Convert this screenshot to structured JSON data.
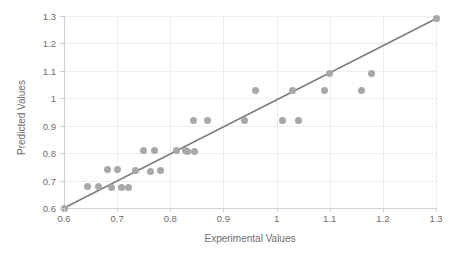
{
  "chart_data": {
    "type": "scatter",
    "title": "",
    "xlabel": "Experimental Values",
    "ylabel": "Predicted Values",
    "xlim": [
      0.6,
      1.3
    ],
    "ylim": [
      0.6,
      1.3
    ],
    "xticks": [
      "0.6",
      "0.7",
      "0.8",
      "0.9",
      "1",
      "1.1",
      "1.2",
      "1.3"
    ],
    "xtick_values": [
      0.6,
      0.7,
      0.8,
      0.9,
      1.0,
      1.1,
      1.2,
      1.3
    ],
    "yticks": [
      "0.6",
      "0.7",
      "0.8",
      "0.9",
      "1",
      "1.1",
      "1.2",
      "1.3"
    ],
    "ytick_values": [
      0.6,
      0.7,
      0.8,
      0.9,
      1.0,
      1.1,
      1.2,
      1.3
    ],
    "grid": true,
    "legend": false,
    "marker_color": "#a8a8a8",
    "line_color": "#7d7d7d",
    "grid_color": "#ededed",
    "axis_color": "#d2d2d2",
    "text_color": "#6d6d6d",
    "series": [
      {
        "name": "Predicted vs Experimental",
        "points": [
          [
            0.6,
            0.6
          ],
          [
            0.645,
            0.68
          ],
          [
            0.665,
            0.68
          ],
          [
            0.682,
            0.74
          ],
          [
            0.69,
            0.675
          ],
          [
            0.701,
            0.74
          ],
          [
            0.708,
            0.675
          ],
          [
            0.722,
            0.675
          ],
          [
            0.735,
            0.735
          ],
          [
            0.75,
            0.81
          ],
          [
            0.762,
            0.732
          ],
          [
            0.77,
            0.81
          ],
          [
            0.782,
            0.738
          ],
          [
            0.811,
            0.81
          ],
          [
            0.828,
            0.81
          ],
          [
            0.833,
            0.806
          ],
          [
            0.843,
            0.92
          ],
          [
            0.845,
            0.806
          ],
          [
            0.87,
            0.92
          ],
          [
            0.94,
            0.92
          ],
          [
            0.96,
            1.03
          ],
          [
            1.012,
            0.92
          ],
          [
            1.03,
            1.03
          ],
          [
            1.042,
            0.92
          ],
          [
            1.1,
            1.09
          ],
          [
            1.09,
            1.03
          ],
          [
            1.16,
            1.03
          ],
          [
            1.178,
            1.09
          ],
          [
            1.3,
            1.29
          ]
        ]
      }
    ],
    "trendline": {
      "name": "identity-line",
      "from": [
        0.6,
        0.6
      ],
      "to": [
        1.3,
        1.29
      ]
    }
  }
}
